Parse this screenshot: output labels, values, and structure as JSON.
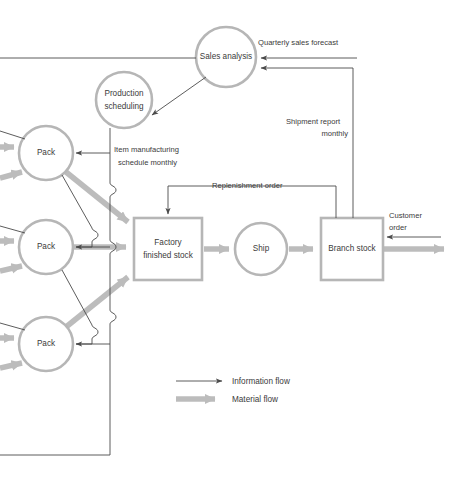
{
  "diagram": {
    "nodes": [
      {
        "id": "sales-analysis",
        "label": "Sales analysis",
        "shape": "circle",
        "cx": 226,
        "cy": 57,
        "r": 30
      },
      {
        "id": "production-scheduling",
        "label_line1": "Production",
        "label_line2": "scheduling",
        "shape": "circle",
        "cx": 124,
        "cy": 100,
        "r": 28
      },
      {
        "id": "pack-1",
        "label": "Pack",
        "shape": "circle",
        "cx": 46,
        "cy": 153,
        "r": 27
      },
      {
        "id": "pack-2",
        "label": "Pack",
        "shape": "circle",
        "cx": 46,
        "cy": 247,
        "r": 27
      },
      {
        "id": "pack-3",
        "label": "Pack",
        "shape": "circle",
        "cx": 46,
        "cy": 344,
        "r": 27
      },
      {
        "id": "factory-finished-stock",
        "label_line1": "Factory",
        "label_line2": "finished stock",
        "shape": "rect",
        "x": 134,
        "y": 218,
        "w": 68,
        "h": 62
      },
      {
        "id": "ship",
        "label": "Ship",
        "shape": "circle",
        "cx": 261,
        "cy": 249,
        "r": 26
      },
      {
        "id": "branch-stock",
        "label": "Branch stock",
        "shape": "rect",
        "x": 321,
        "y": 218,
        "w": 62,
        "h": 62
      }
    ],
    "edge_labels": {
      "quarterly_sales_forecast": "Quarterly sales forecast",
      "shipment_report_line1": "Shipment report",
      "shipment_report_line2": "monthly",
      "item_manufacturing_line1": "Item manufacturing",
      "item_manufacturing_line2": "schedule  monthly",
      "replenishment_order": "Replenishment order",
      "customer_order_line1": "Customer",
      "customer_order_line2": "order"
    },
    "legend": {
      "items": [
        {
          "id": "information-flow",
          "label": "Information flow",
          "type": "information",
          "color": "#4a4a4a"
        },
        {
          "id": "material-flow",
          "label": "Material flow",
          "type": "material",
          "color": "#bcbcbc"
        }
      ]
    },
    "colors": {
      "shape_stroke": "#b6b6b6",
      "information_flow": "#4a4a4a",
      "material_flow": "#bcbcbc",
      "text": "#3b3b3b",
      "background": "#ffffff"
    }
  }
}
